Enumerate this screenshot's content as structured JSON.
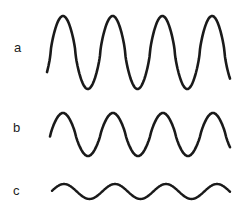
{
  "figure": {
    "waves": [
      {
        "label": "a",
        "amplitude": "large",
        "cycles": 4,
        "y_top": 16,
        "y_bottom": 89
      },
      {
        "label": "b",
        "amplitude": "medium",
        "cycles": 4,
        "y_top": 113,
        "y_bottom": 156
      },
      {
        "label": "c",
        "amplitude": "small",
        "cycles": 4,
        "y_top": 184,
        "y_bottom": 199
      }
    ],
    "stroke_color": "#1a1a1a"
  }
}
